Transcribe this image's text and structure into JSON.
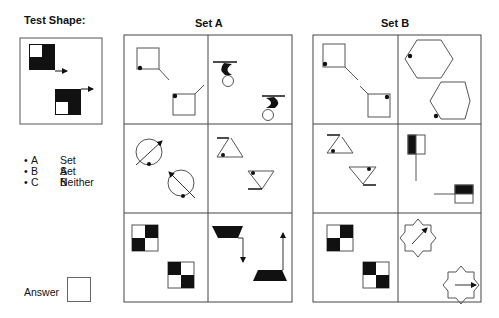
{
  "test_shape": {
    "label": "Test Shape:"
  },
  "set_a": {
    "label": "Set A"
  },
  "set_b": {
    "label": "Set B"
  },
  "options": [
    {
      "letter": "A",
      "text": "Set A"
    },
    {
      "letter": "B",
      "text": "Set B"
    },
    {
      "letter": "C",
      "text": "Neither"
    }
  ],
  "answer": {
    "label": "Answer",
    "value": ""
  },
  "colors": {
    "stroke": "#555555",
    "fill": "#111111",
    "grid": "#444444"
  }
}
